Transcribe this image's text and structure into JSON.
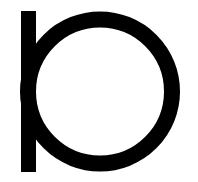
{
  "logo": {
    "name": "ring-and-bar-glyph",
    "label": "",
    "colors": {
      "foreground": "#000000",
      "background": "#ffffff"
    },
    "bar": {
      "x": 21,
      "y": 11,
      "width": 15,
      "height": 161
    },
    "ring": {
      "cx": 100,
      "cy": 91.5,
      "r": 72,
      "stroke_width": 16
    }
  }
}
